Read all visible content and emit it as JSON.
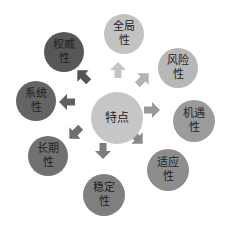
{
  "diagram": {
    "center": {
      "label": "特点",
      "color": "#c6c6c6",
      "cx": 117,
      "cy": 118,
      "r": 26
    },
    "nodes": [
      {
        "id": "quanju",
        "line1": "全局",
        "line2": "性",
        "color": "#c2c2c2",
        "cx": 124,
        "cy": 34,
        "r": 20
      },
      {
        "id": "fengxian",
        "line1": "风险",
        "line2": "性",
        "color": "#b7b7b7",
        "cx": 178,
        "cy": 68,
        "r": 20
      },
      {
        "id": "jiyu",
        "line1": "机遇",
        "line2": "性",
        "color": "#9b9b9b",
        "cx": 194,
        "cy": 121,
        "r": 21
      },
      {
        "id": "shiying",
        "line1": "适应",
        "line2": "性",
        "color": "#8d8d8d",
        "cx": 168,
        "cy": 170,
        "r": 21
      },
      {
        "id": "wending",
        "line1": "稳定",
        "line2": "性",
        "color": "#7f7f7f",
        "cx": 104,
        "cy": 195,
        "r": 21
      },
      {
        "id": "changqi",
        "line1": "长期",
        "line2": "性",
        "color": "#717171",
        "cx": 48,
        "cy": 156,
        "r": 20
      },
      {
        "id": "xitong",
        "line1": "系统",
        "line2": "性",
        "color": "#646464",
        "cx": 36,
        "cy": 101,
        "r": 20
      },
      {
        "id": "quanwei",
        "line1": "权威",
        "line2": "性",
        "color": "#575757",
        "cx": 64,
        "cy": 52,
        "r": 20
      }
    ],
    "arrows": [
      {
        "target": "quanju",
        "color": "#c4c4c4",
        "x": 118,
        "y": 70,
        "angle": 0
      },
      {
        "target": "fengxian",
        "color": "#b3b3b3",
        "x": 143,
        "y": 79,
        "angle": 45
      },
      {
        "target": "jiyu",
        "color": "#999999",
        "x": 152,
        "y": 110,
        "angle": 90
      },
      {
        "target": "shiying",
        "color": "#8a8a8a",
        "x": 137,
        "y": 138,
        "angle": 135
      },
      {
        "target": "wending",
        "color": "#7c7c7c",
        "x": 103,
        "y": 151,
        "angle": 180
      },
      {
        "target": "changqi",
        "color": "#6e6e6e",
        "x": 75,
        "y": 133,
        "angle": 225
      },
      {
        "target": "xitong",
        "color": "#606060",
        "x": 67,
        "y": 102,
        "angle": 270
      },
      {
        "target": "quanwei",
        "color": "#535353",
        "x": 83,
        "y": 76,
        "angle": 315
      }
    ]
  }
}
